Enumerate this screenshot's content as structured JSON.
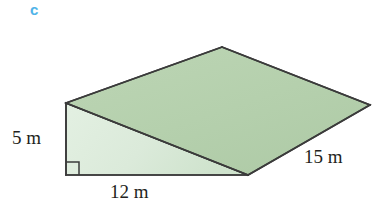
{
  "part_label": {
    "text": "c",
    "color": "#4fb3e8"
  },
  "figure": {
    "name": "triangular-prism-ramp",
    "colors": {
      "top_face_fill": "#b7d2af",
      "front_face_fill": "#dcebdb",
      "outline": "#3b3b3b"
    },
    "vertices": {
      "front_top_left": [
        66,
        103
      ],
      "front_bottom_left": [
        66,
        175
      ],
      "front_bottom_right": [
        248,
        175
      ],
      "back_top_apex": [
        222,
        47
      ],
      "back_right": [
        370,
        105
      ]
    },
    "right_angle_marker": {
      "name": "right-angle-mark",
      "at": [
        66,
        175
      ],
      "size": 13
    }
  },
  "dimensions": {
    "height": {
      "value": "5 m",
      "edge": "vertical-left-edge"
    },
    "base": {
      "value": "12 m",
      "edge": "bottom-horizontal-edge"
    },
    "depth": {
      "value": "15 m",
      "edge": "right-slanted-edge"
    }
  }
}
